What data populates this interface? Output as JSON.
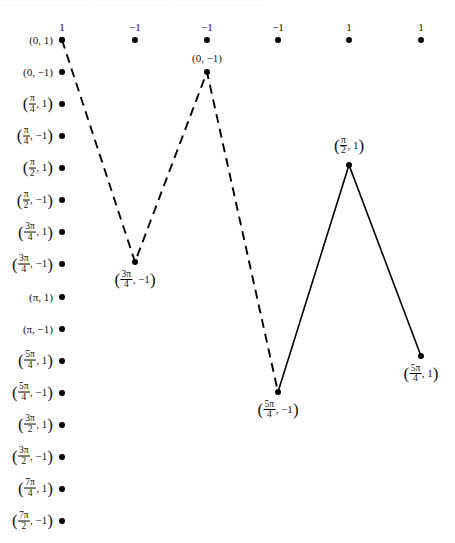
{
  "figure": {
    "top_cutoff_text": "............  ......  ..................................................................................................  ...........  ........",
    "dot_color": "#000000",
    "line_color": "#000000"
  },
  "row_labels": [
    {
      "text": "(0, 1)",
      "kind": "plain",
      "x": 0,
      "pi_num": "",
      "pi_den": "",
      "y_value": "1"
    },
    {
      "text": "(0, -1)",
      "kind": "plain",
      "x": 0,
      "pi_num": "",
      "pi_den": "",
      "y_value": "-1"
    },
    {
      "text": "(pi/4, 1)",
      "kind": "frac",
      "pi_num": "π",
      "pi_den": "4",
      "y_value": "1"
    },
    {
      "text": "(pi/4, -1)",
      "kind": "frac",
      "pi_num": "π",
      "pi_den": "4",
      "y_value": "-1"
    },
    {
      "text": "(pi/2, 1)",
      "kind": "frac",
      "pi_num": "π",
      "pi_den": "2",
      "y_value": "1"
    },
    {
      "text": "(pi/2, -1)",
      "kind": "frac",
      "pi_num": "π",
      "pi_den": "2",
      "y_value": "-1"
    },
    {
      "text": "(3pi/4, 1)",
      "kind": "frac",
      "pi_num": "3π",
      "pi_den": "4",
      "y_value": "1"
    },
    {
      "text": "(3pi/4, -1)",
      "kind": "frac",
      "pi_num": "3π",
      "pi_den": "4",
      "y_value": "-1"
    },
    {
      "text": "(π, 1)",
      "kind": "plain",
      "pi_num": "",
      "pi_den": "",
      "y_value": "1"
    },
    {
      "text": "(π, -1)",
      "kind": "plain",
      "pi_num": "",
      "pi_den": "",
      "y_value": "-1"
    },
    {
      "text": "(5pi/4, 1)",
      "kind": "frac",
      "pi_num": "5π",
      "pi_den": "4",
      "y_value": "1"
    },
    {
      "text": "(5pi/4, -1)",
      "kind": "frac",
      "pi_num": "5π",
      "pi_den": "4",
      "y_value": "-1"
    },
    {
      "text": "(3pi/2, 1)",
      "kind": "frac",
      "pi_num": "3π",
      "pi_den": "2",
      "y_value": "1"
    },
    {
      "text": "(3pi/2, -1)",
      "kind": "frac",
      "pi_num": "3π",
      "pi_den": "2",
      "y_value": "-1"
    },
    {
      "text": "(7pi/4, 1)",
      "kind": "frac",
      "pi_num": "7π",
      "pi_den": "4",
      "y_value": "1"
    },
    {
      "text": "(7pi/4, -1)",
      "kind": "frac",
      "pi_num": "7π",
      "pi_den": "2",
      "y_value": "-1"
    }
  ],
  "top_row_values": [
    "1",
    "−1",
    "−1",
    "−1",
    "1",
    "1"
  ],
  "vertex_labels": [
    {
      "name": "origin-minus-one",
      "text": "(0, −1)",
      "kind": "plain",
      "x": 207,
      "y": 72,
      "place": "above"
    },
    {
      "name": "three-pi-over-four-minus-one",
      "kind": "frac",
      "pi_num": "3π",
      "pi_den": "4",
      "y_value": "−1",
      "x": 135,
      "y": 262,
      "place": "below"
    },
    {
      "name": "five-pi-over-four-minus-one",
      "kind": "frac",
      "pi_num": "5π",
      "pi_den": "4",
      "y_value": "−1",
      "x": 278,
      "y": 392,
      "place": "below"
    },
    {
      "name": "pi-over-two-one",
      "kind": "frac",
      "pi_num": "π",
      "pi_den": "2",
      "y_value": "1",
      "x": 349,
      "y": 165,
      "place": "above"
    },
    {
      "name": "five-pi-over-four-one",
      "kind": "frac",
      "pi_num": "5π",
      "pi_den": "4",
      "y_value": "1",
      "x": 421,
      "y": 356,
      "place": "below"
    }
  ],
  "chart_data": {
    "type": "line",
    "title": "",
    "xlabel": "",
    "ylabel": "",
    "grid": false,
    "legend": "none",
    "xlim": [
      0,
      455
    ],
    "ylim": [
      543,
      0
    ],
    "column_dots": {
      "x": 62,
      "y_start": 40,
      "y_step": 32.07,
      "count": 16
    },
    "top_row_dots": {
      "y": 40,
      "x_values": [
        62,
        135,
        207,
        278,
        349,
        421
      ],
      "labels": [
        "1",
        "−1",
        "−1",
        "−1",
        "1",
        "1"
      ]
    },
    "series": [
      {
        "name": "dashed-path",
        "style": "dashed",
        "points": [
          [
            62,
            40
          ],
          [
            135,
            262
          ],
          [
            207,
            72
          ],
          [
            278,
            392
          ]
        ]
      },
      {
        "name": "solid-path",
        "style": "solid",
        "points": [
          [
            278,
            392
          ],
          [
            349,
            165
          ],
          [
            421,
            356
          ]
        ]
      }
    ],
    "annotated_points": [
      {
        "label": "(0, 1)",
        "x": 62,
        "y": 40
      },
      {
        "label": "(0, −1)",
        "x": 207,
        "y": 72
      },
      {
        "label": "(3π/4, −1)",
        "x": 135,
        "y": 262
      },
      {
        "label": "(5π/4, −1)",
        "x": 278,
        "y": 392
      },
      {
        "label": "(π/2, 1)",
        "x": 349,
        "y": 165
      },
      {
        "label": "(5π/4, 1)",
        "x": 421,
        "y": 356
      }
    ]
  }
}
